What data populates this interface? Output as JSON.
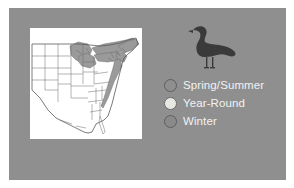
{
  "figure": {
    "name": "bird-range-map-figure",
    "background_color": "#ffffff",
    "panel_color": "#8f8f8f",
    "map_card_color": "#ffffff"
  },
  "bird": {
    "icon_name": "gull-silhouette-icon",
    "color": "#3a3a3a",
    "description": "Standing gull silhouette facing left"
  },
  "map": {
    "name": "us-range-map",
    "region": "Eastern and Central United States",
    "outline_color": "#5a5a5a",
    "shading_color": "#9a9a9a",
    "background": "#ffffff"
  },
  "legend": {
    "name": "range-legend",
    "items": [
      {
        "label": "Spring/Summer",
        "swatch_name": "swatch-spring-summer",
        "fill": "#8f8f8f",
        "stroke": "#5e5e5e"
      },
      {
        "label": "Year-Round",
        "swatch_name": "swatch-year-round",
        "fill": "#e8e8e3",
        "stroke": "#6a6a6a"
      },
      {
        "label": "Winter",
        "swatch_name": "swatch-winter",
        "fill": "#8a8a8a",
        "stroke": "#5e5e5e"
      }
    ],
    "label_color": "#f2f2f2"
  }
}
